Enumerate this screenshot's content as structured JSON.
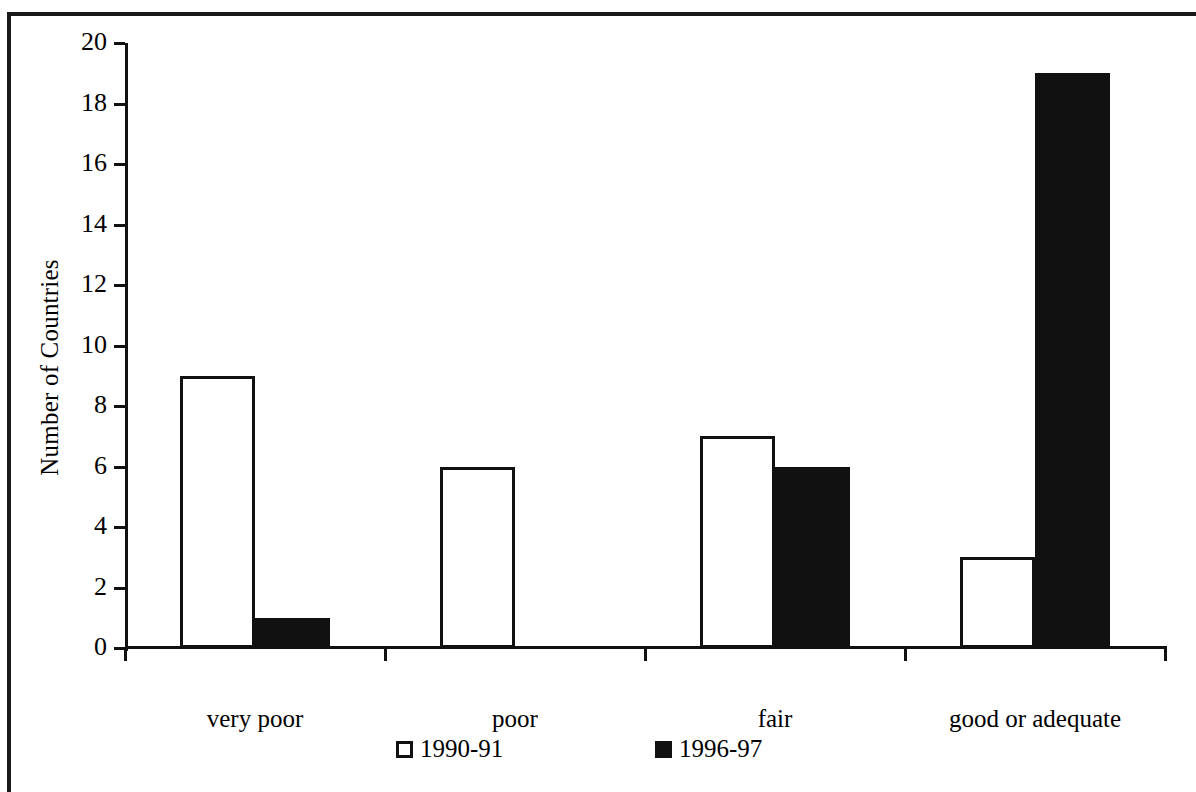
{
  "chart_data": {
    "type": "bar",
    "title": "",
    "xlabel": "",
    "ylabel": "Number of Countries",
    "categories": [
      "very poor",
      "poor",
      "fair",
      "good or adequate"
    ],
    "series": [
      {
        "name": "1990-91",
        "style": "outlined-white",
        "values": [
          9,
          6,
          7,
          3
        ]
      },
      {
        "name": "1996-97",
        "style": "solid-black",
        "values": [
          1,
          0,
          6,
          19
        ]
      }
    ],
    "ylim": [
      0,
      20
    ],
    "ytick_step": 2,
    "ytick_labels": [
      "0",
      "2",
      "4",
      "6",
      "8",
      "10",
      "12",
      "14",
      "16",
      "18",
      "20"
    ],
    "grid": false,
    "legend_position": "bottom",
    "colors": {
      "axis": "#111111",
      "series_1990_91_fill": "#ffffff",
      "series_1990_91_stroke": "#111111",
      "series_1996_97_fill": "#111111",
      "background": "#ffffff"
    }
  },
  "legend": {
    "items": [
      {
        "label": "1990-91",
        "swatch": "open-square"
      },
      {
        "label": "1996-97",
        "swatch": "filled-square"
      }
    ]
  }
}
